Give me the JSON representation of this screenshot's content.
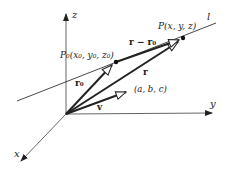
{
  "diagram": {
    "type": "vector-line-3d",
    "axes": {
      "x_label": "x",
      "y_label": "y",
      "z_label": "z"
    },
    "line": {
      "label": "l"
    },
    "points": {
      "p0": {
        "label": "P₀(x₀, y₀, z₀)"
      },
      "p": {
        "label": "P(x, y, z)"
      }
    },
    "vectors": {
      "r0": {
        "label": "r₀"
      },
      "r": {
        "label": "r"
      },
      "r_minus_r0": {
        "label": "r − r₀"
      },
      "v": {
        "label": "v"
      },
      "direction": {
        "label": "(a, b, c)"
      }
    },
    "colors": {
      "stroke": "#222222",
      "axis": "#555555",
      "background": "#ffffff"
    }
  }
}
